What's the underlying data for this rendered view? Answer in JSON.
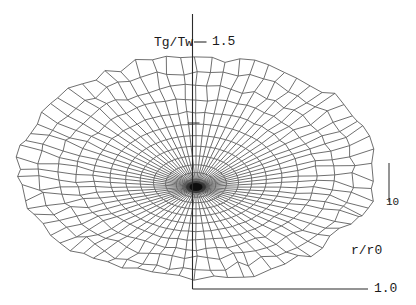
{
  "figure": {
    "z_axis_label": "Tg/Tw",
    "z_tick_top_label": "1.5",
    "z_tick_bottom_label": "1.0",
    "r_axis_label": "r/r0",
    "scale_marker_label": "10"
  },
  "chart_data": {
    "type": "surface_wireframe_3d",
    "projection": "elevated view of polar mesh disk",
    "title": "",
    "zlabel": "Tg/Tw",
    "xlabel": "r/r0",
    "z_ticks": [
      1.0,
      1.5
    ],
    "z_range": [
      1.0,
      1.5
    ],
    "scale_marker": "10",
    "grid": "polar wireframe mesh, no filled surface",
    "mesh": {
      "spokes": 72,
      "spoke_step_deg": 5,
      "rings": 13,
      "radial_spacing": "r_k = (k/13)^1.5 (rings denser toward center)"
    },
    "surface_profile": {
      "r_over_r0": [
        0,
        0.2,
        0.4,
        0.6,
        0.8,
        1.0
      ],
      "tg_over_tw": [
        1.21,
        1.22,
        1.22,
        1.23,
        1.24,
        1.25
      ]
    },
    "layout": {
      "cx": 196,
      "cy_rim": 168,
      "rx": 178,
      "ry": 111,
      "center_dip": 19,
      "angular_samples": 72,
      "rings": 13,
      "radial_exponent": 1.5,
      "noise_start_r": 0.45,
      "noise_amp": 4.5,
      "notch_deg": 353,
      "notch_halfwidth_deg": 22,
      "notch_depth": 13,
      "axis_x": 192.5,
      "axis_top": 14,
      "axis_bottom": 289,
      "tick15_y": 42,
      "tick_mid_y": 123,
      "baseline_right_x": 368,
      "scalebar_x": 389,
      "scalebar_y1": 163,
      "scalebar_y2": 202
    }
  },
  "colors": {
    "background": "#ffffff",
    "mesh_line": "#5f5f5f",
    "axis_line": "#2b2b2b",
    "text": "#1a1a1a",
    "center_blob": "#0d0d0d"
  }
}
